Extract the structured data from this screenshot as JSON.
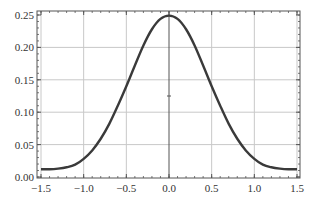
{
  "chart_data": {
    "type": "line",
    "title": "",
    "xlabel": "",
    "ylabel": "",
    "xlim": [
      -1.5,
      1.5
    ],
    "ylim": [
      0.0,
      0.25
    ],
    "grid": true,
    "xticks": [
      -1.5,
      -1.0,
      -0.5,
      0.0,
      0.5,
      1.0,
      1.5
    ],
    "xtick_labels": [
      "−1.5",
      "−1.0",
      "−0.5",
      "0.0",
      "0.5",
      "1.0",
      "1.5"
    ],
    "yticks": [
      0.0,
      0.05,
      0.1,
      0.15,
      0.2,
      0.25
    ],
    "ytick_labels": [
      "0.00",
      "0.05",
      "0.10",
      "0.15",
      "0.20",
      "0.25"
    ],
    "series": [
      {
        "name": "curve",
        "color": "#3a3a3a",
        "x": [
          -1.5,
          -1.4,
          -1.3,
          -1.2,
          -1.1,
          -1.0,
          -0.9,
          -0.8,
          -0.7,
          -0.6,
          -0.5,
          -0.4,
          -0.3,
          -0.2,
          -0.1,
          0.0,
          0.1,
          0.2,
          0.3,
          0.4,
          0.5,
          0.6,
          0.7,
          0.8,
          0.9,
          1.0,
          1.1,
          1.2,
          1.3,
          1.4,
          1.5
        ],
        "y": [
          0.012,
          0.012,
          0.013,
          0.015,
          0.019,
          0.028,
          0.041,
          0.059,
          0.082,
          0.11,
          0.14,
          0.172,
          0.203,
          0.228,
          0.244,
          0.249,
          0.244,
          0.228,
          0.203,
          0.172,
          0.14,
          0.11,
          0.082,
          0.059,
          0.041,
          0.028,
          0.019,
          0.015,
          0.013,
          0.012,
          0.012
        ]
      }
    ]
  }
}
